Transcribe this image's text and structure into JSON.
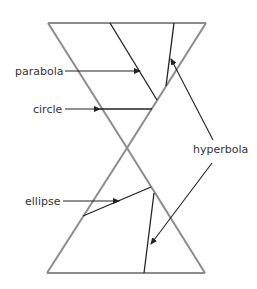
{
  "diagram": {
    "labels": {
      "parabola": "parabola",
      "circle": "circle",
      "ellipse": "ellipse",
      "hyperbola": "hyperbola"
    },
    "colors": {
      "cone": "#8c8c8c",
      "section": "#222222",
      "arrow": "#222222",
      "text": "#333333"
    }
  }
}
